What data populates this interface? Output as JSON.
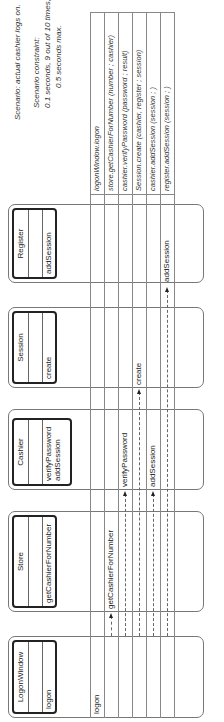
{
  "scenario": {
    "title": "Scenario:  actual cashier logs on.",
    "constraint_label": "Scenario constraint:",
    "constraint_line1": "0.1 seconds, 9 out of 10 times,",
    "constraint_line2": "0.5 seconds max."
  },
  "objects": [
    {
      "name": "LogonWindow",
      "operations": [
        "logon"
      ]
    },
    {
      "name": "Store",
      "operations": [
        "getCashierForNumber"
      ]
    },
    {
      "name": "Cashier",
      "operations": [
        "verifyPassword",
        "addSession"
      ]
    },
    {
      "name": "Session",
      "operations": [
        "create"
      ]
    },
    {
      "name": "Register",
      "operations": [
        "addSession"
      ]
    }
  ],
  "messages": [
    {
      "label": "logon",
      "row": 0,
      "target": "LogonWindow"
    },
    {
      "label": "getCashierForNumber",
      "row": 1,
      "target": "Store"
    },
    {
      "label": "verifyPassword",
      "row": 2,
      "target": "Cashier"
    },
    {
      "label": "create",
      "row": 3,
      "target": "Session"
    },
    {
      "label": "addSession",
      "row": 4,
      "target": "Cashier"
    },
    {
      "label": "addSession",
      "row": 5,
      "target": "Register"
    }
  ],
  "script": [
    "logonWindow.logon",
    "store.getCashierForNumber (number ; cashier)",
    "cashier.verifyPassword (password ; result)",
    "Session.create (cashier, register ; session)",
    "cashier.addSession (session ; )",
    "register.addSession (session ; )"
  ]
}
